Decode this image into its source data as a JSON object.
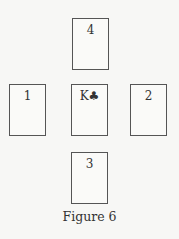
{
  "figure": {
    "caption": "Figure 6",
    "cards": [
      {
        "position": "top",
        "label": "4"
      },
      {
        "position": "left",
        "label": "1"
      },
      {
        "position": "center",
        "label": "K♣",
        "rank": "K",
        "suit": "clubs"
      },
      {
        "position": "right",
        "label": "2"
      },
      {
        "position": "bottom",
        "label": "3"
      }
    ]
  }
}
